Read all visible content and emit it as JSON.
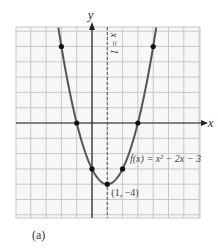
{
  "chart_data": {
    "type": "line",
    "title": "",
    "function_label": "f(x) = x² − 2x − 3",
    "xlabel": "x",
    "ylabel": "y",
    "axis_of_symmetry_label": "x = 1",
    "vertex_label": "(1, −4)",
    "xlim": [
      -5,
      7
    ],
    "ylim": [
      -6,
      6
    ],
    "grid": true,
    "points": [
      {
        "x": -2,
        "y": 5
      },
      {
        "x": -1,
        "y": 0
      },
      {
        "x": 0,
        "y": -3
      },
      {
        "x": 1,
        "y": -4
      },
      {
        "x": 2,
        "y": -3
      },
      {
        "x": 3,
        "y": 0
      },
      {
        "x": 4,
        "y": 5
      }
    ],
    "caption": "(a)"
  }
}
